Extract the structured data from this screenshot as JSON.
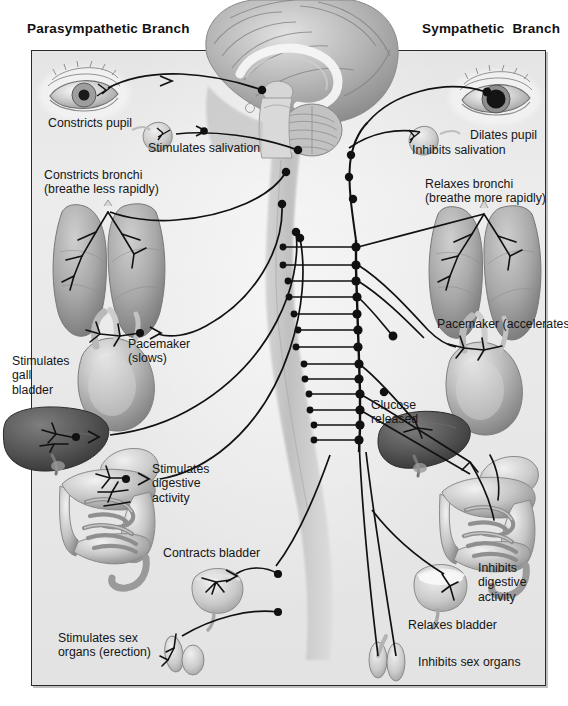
{
  "figure": {
    "kind": "anatomical-diagram",
    "background_color": "#ececec",
    "line_color": "#111111",
    "frame_border_color": "#2a2a2a"
  },
  "headings": {
    "left": "Parasympathetic Branch",
    "right": "Sympathetic  Branch"
  },
  "parasympathetic": {
    "labels": [
      {
        "id": "constricts-pupil",
        "text": "Constricts pupil",
        "x": 48,
        "y": 116,
        "align": "left"
      },
      {
        "id": "stimulates-salivation",
        "text": "Stimulates salivation",
        "x": 148,
        "y": 141,
        "align": "left"
      },
      {
        "id": "constricts-bronchi",
        "text": "Constricts bronchi\n(breathe less rapidly)",
        "x": 44,
        "y": 168,
        "align": "left"
      },
      {
        "id": "pacemaker-slows",
        "text": "Pacemaker\n(slows)",
        "x": 128,
        "y": 337,
        "align": "left"
      },
      {
        "id": "stimulates-gall-bladder",
        "text": "Stimulates\ngall\nbladder",
        "x": 12,
        "y": 354,
        "align": "left"
      },
      {
        "id": "stimulates-digestive",
        "text": "Stimulates\ndigestive\nactivity",
        "x": 152,
        "y": 462,
        "align": "left"
      },
      {
        "id": "contracts-bladder",
        "text": "Contracts bladder",
        "x": 163,
        "y": 546,
        "align": "left"
      },
      {
        "id": "stimulates-sex-organs",
        "text": "Stimulates sex\norgans (erection)",
        "x": 58,
        "y": 631,
        "align": "left"
      }
    ],
    "organs": [
      "eye",
      "salivary-gland",
      "lungs",
      "heart",
      "liver-gall-bladder",
      "intestines",
      "bladder",
      "sex-organs"
    ]
  },
  "sympathetic": {
    "labels": [
      {
        "id": "dilates-pupil",
        "text": "Dilates pupil",
        "x": 470,
        "y": 128,
        "align": "left"
      },
      {
        "id": "inhibits-salivation",
        "text": "Inhibits salivation",
        "x": 412,
        "y": 143,
        "align": "left"
      },
      {
        "id": "relaxes-bronchi",
        "text": "Relaxes bronchi\n(breathe more rapidly)",
        "x": 425,
        "y": 177,
        "align": "left"
      },
      {
        "id": "pacemaker-accelerates",
        "text": "Pacemaker (accelerates)",
        "x": 437,
        "y": 317,
        "align": "left"
      },
      {
        "id": "glucose-released",
        "text": "Glucose\nreleased",
        "x": 371,
        "y": 398,
        "align": "left"
      },
      {
        "id": "inhibits-digestive",
        "text": "Inhibits\ndigestive\nactivity",
        "x": 478,
        "y": 561,
        "align": "left"
      },
      {
        "id": "relaxes-bladder",
        "text": "Relaxes bladder",
        "x": 408,
        "y": 618,
        "align": "left"
      },
      {
        "id": "inhibits-sex-organs",
        "text": "Inhibits sex organs",
        "x": 418,
        "y": 655,
        "align": "left"
      }
    ],
    "organs": [
      "eye",
      "salivary-gland",
      "lungs",
      "heart",
      "liver",
      "intestines",
      "bladder",
      "sex-organs"
    ],
    "ganglion_chain": {
      "description": "sympathetic chain ganglia along the spinal cord",
      "node_count": 13
    }
  },
  "central": {
    "structures": [
      "cerebrum-midsagittal",
      "corpus-callosum",
      "cerebellum",
      "brainstem",
      "spinal-cord"
    ]
  }
}
